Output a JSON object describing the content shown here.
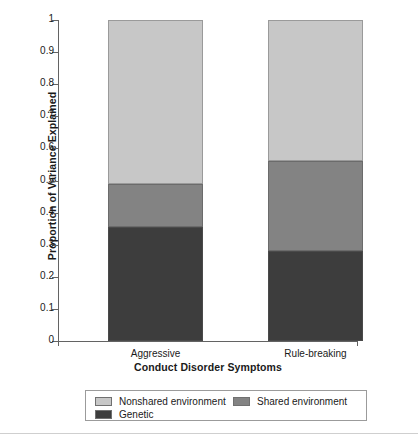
{
  "chart_data": {
    "type": "bar",
    "subtype": "stacked-bar",
    "title": "",
    "xlabel": "Conduct Disorder Symptoms",
    "ylabel": "Proportion of Variance Explained",
    "categories": [
      "Aggressive",
      "Rule-breaking"
    ],
    "ylim": [
      0,
      1
    ],
    "yticks": [
      "0",
      "0.1",
      "0.2",
      "0.3",
      "0.4",
      "0.5",
      "0.6",
      "0.7",
      "0.8",
      "0.9",
      "1"
    ],
    "ytick_values": [
      0,
      0.1,
      0.2,
      0.3,
      0.4,
      0.5,
      0.6,
      0.7,
      0.8,
      0.9,
      1
    ],
    "grid": false,
    "legend_position": "bottom",
    "stack_order_bottom_to_top": [
      "Genetic",
      "Shared environment",
      "Nonshared environment"
    ],
    "series": [
      {
        "name": "Genetic",
        "color": "#3d3d3d",
        "values": [
          0.355,
          0.28
        ],
        "cumulative_top": [
          0.355,
          0.28
        ]
      },
      {
        "name": "Shared environment",
        "color": "#838383",
        "values": [
          0.135,
          0.28
        ],
        "cumulative_top": [
          0.49,
          0.56
        ]
      },
      {
        "name": "Nonshared environment",
        "color": "#c7c7c7",
        "values": [
          0.51,
          0.44
        ],
        "cumulative_top": [
          1.0,
          1.0
        ]
      }
    ]
  },
  "axes": {
    "y": {
      "title": "Proportion of Variance Explained",
      "ticks": [
        {
          "label": "1",
          "value": 1.0
        },
        {
          "label": "0.9",
          "value": 0.9
        },
        {
          "label": "0.8",
          "value": 0.8
        },
        {
          "label": "0.7",
          "value": 0.7
        },
        {
          "label": "0.6",
          "value": 0.6
        },
        {
          "label": "0.5",
          "value": 0.5
        },
        {
          "label": "0.4",
          "value": 0.4
        },
        {
          "label": "0.3",
          "value": 0.3
        },
        {
          "label": "0.2",
          "value": 0.2
        },
        {
          "label": "0.1",
          "value": 0.1
        },
        {
          "label": "0",
          "value": 0.0
        }
      ]
    },
    "x": {
      "title": "Conduct Disorder Symptoms",
      "categories": [
        {
          "label": "Aggressive"
        },
        {
          "label": "Rule-breaking"
        }
      ]
    }
  },
  "legend": {
    "items": [
      {
        "label": "Nonshared environment",
        "color": "#c7c7c7"
      },
      {
        "label": "Shared environment",
        "color": "#838383"
      },
      {
        "label": "Genetic",
        "color": "#3d3d3d"
      }
    ]
  },
  "colors": {
    "nonshared": "#c7c7c7",
    "shared": "#838383",
    "genetic": "#3d3d3d",
    "axis": "#636363",
    "text": "#1a1a1a",
    "legend_border": "#9b9b9b"
  }
}
